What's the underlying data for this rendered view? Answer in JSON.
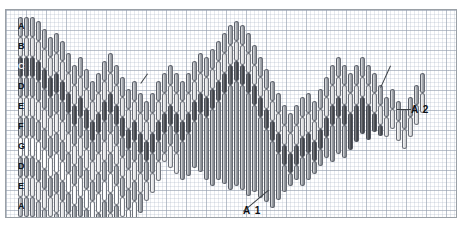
{
  "figure": {
    "title": "",
    "frame": {
      "x": 5,
      "y": 9,
      "width": 450,
      "height": 207,
      "border_color": "#9aa0a6"
    },
    "grid": {
      "minor_px": 4,
      "major_px": 20,
      "minor_color": "#afb9c8",
      "major_color": "#96a0af",
      "visible": true
    },
    "background_color": "#ffffff"
  },
  "legend_column": {
    "description": "First (leftmost) stacked column, each band letter-labelled top to bottom",
    "labels": [
      "A",
      "B",
      "C",
      "D",
      "E",
      "F",
      "G",
      "D",
      "E",
      "A"
    ],
    "shades": [
      "A",
      "B",
      "C",
      "D",
      "E",
      "F",
      "G",
      "D",
      "E",
      "H"
    ],
    "shade_hex": {
      "A": "#9fa3a9",
      "B": "#d9dadc",
      "C": "#4c4f54",
      "D": "#93979d",
      "E": "#e3e4e6",
      "F": "#9a9ea4",
      "G": "#ffffff",
      "H": "#b0b4b9"
    }
  },
  "annotations": [
    {
      "name": "A1",
      "label": "A 1",
      "x": 243,
      "y": 211,
      "points_to_x": 268,
      "points_to_y": 190
    },
    {
      "name": "A2",
      "label": "A 2",
      "x": 411,
      "y": 110,
      "points_to_x": 397,
      "points_to_y": 110
    },
    {
      "name": "pointer-left",
      "label": "",
      "x": 148,
      "y": 74,
      "points_to_x": 141,
      "points_to_y": 84
    },
    {
      "name": "pointer-right",
      "label": "",
      "x": 391,
      "y": 66,
      "points_to_x": 381,
      "points_to_y": 88
    }
  ],
  "chart_data": {
    "type": "bar",
    "subtype": "stacked-band candlestick profile",
    "title": "",
    "xlabel": "",
    "ylabel": "",
    "xlim": [
      0,
      450
    ],
    "ylim": [
      0,
      207
    ],
    "grid": true,
    "legend_position": "inline-left-column",
    "band_order": [
      "A",
      "B",
      "C",
      "D",
      "E",
      "F",
      "G",
      "D",
      "E",
      "A"
    ],
    "band_shades": [
      "A",
      "B",
      "C",
      "D",
      "E",
      "F",
      "G",
      "D",
      "E",
      "H"
    ],
    "note": "Each x position is one vertical column. 'top' is the pixel y of the column's upper end inside the plot, 'segments' is how many of the band_order bands are drawn downward from that top. Columns are 5px wide on a 6px pitch.",
    "bar_pitch": 6,
    "bar_width": 5,
    "band_height": 20,
    "columns": [
      {
        "x": 12,
        "top": 7,
        "segments": 10
      },
      {
        "x": 18,
        "top": 7,
        "segments": 10
      },
      {
        "x": 24,
        "top": 7,
        "segments": 10
      },
      {
        "x": 30,
        "top": 11,
        "segments": 10
      },
      {
        "x": 36,
        "top": 19,
        "segments": 10
      },
      {
        "x": 42,
        "top": 27,
        "segments": 10
      },
      {
        "x": 48,
        "top": 23,
        "segments": 10
      },
      {
        "x": 54,
        "top": 31,
        "segments": 10
      },
      {
        "x": 60,
        "top": 43,
        "segments": 9
      },
      {
        "x": 66,
        "top": 55,
        "segments": 9
      },
      {
        "x": 72,
        "top": 47,
        "segments": 9
      },
      {
        "x": 78,
        "top": 59,
        "segments": 9
      },
      {
        "x": 84,
        "top": 71,
        "segments": 8
      },
      {
        "x": 90,
        "top": 63,
        "segments": 9
      },
      {
        "x": 96,
        "top": 51,
        "segments": 9
      },
      {
        "x": 102,
        "top": 43,
        "segments": 9
      },
      {
        "x": 108,
        "top": 55,
        "segments": 9
      },
      {
        "x": 114,
        "top": 67,
        "segments": 8
      },
      {
        "x": 120,
        "top": 79,
        "segments": 7
      },
      {
        "x": 126,
        "top": 71,
        "segments": 7
      },
      {
        "x": 132,
        "top": 83,
        "segments": 6
      },
      {
        "x": 138,
        "top": 91,
        "segments": 5
      },
      {
        "x": 144,
        "top": 83,
        "segments": 5
      },
      {
        "x": 150,
        "top": 71,
        "segments": 5
      },
      {
        "x": 156,
        "top": 63,
        "segments": 4
      },
      {
        "x": 162,
        "top": 55,
        "segments": 4
      },
      {
        "x": 168,
        "top": 63,
        "segments": 4
      },
      {
        "x": 174,
        "top": 71,
        "segments": 3
      },
      {
        "x": 180,
        "top": 63,
        "segments": 3
      },
      {
        "x": 186,
        "top": 51,
        "segments": 3
      },
      {
        "x": 192,
        "top": 43,
        "segments": 3
      },
      {
        "x": 198,
        "top": 47,
        "segments": 3
      },
      {
        "x": 204,
        "top": 39,
        "segments": 3
      },
      {
        "x": 210,
        "top": 31,
        "segments": 3
      },
      {
        "x": 216,
        "top": 23,
        "segments": 3
      },
      {
        "x": 222,
        "top": 15,
        "segments": 3
      },
      {
        "x": 228,
        "top": 11,
        "segments": 3
      },
      {
        "x": 234,
        "top": 15,
        "segments": 3
      },
      {
        "x": 240,
        "top": 23,
        "segments": 3
      },
      {
        "x": 246,
        "top": 35,
        "segments": 3
      },
      {
        "x": 252,
        "top": 47,
        "segments": 3
      },
      {
        "x": 258,
        "top": 59,
        "segments": 3
      },
      {
        "x": 264,
        "top": 71,
        "segments": 3
      },
      {
        "x": 270,
        "top": 83,
        "segments": 3
      },
      {
        "x": 276,
        "top": 95,
        "segments": 3
      },
      {
        "x": 282,
        "top": 103,
        "segments": 3
      },
      {
        "x": 288,
        "top": 95,
        "segments": 3
      },
      {
        "x": 294,
        "top": 87,
        "segments": 3
      },
      {
        "x": 300,
        "top": 83,
        "segments": 3
      },
      {
        "x": 306,
        "top": 91,
        "segments": 3
      },
      {
        "x": 312,
        "top": 79,
        "segments": 3
      },
      {
        "x": 318,
        "top": 67,
        "segments": 3
      },
      {
        "x": 324,
        "top": 55,
        "segments": 3
      },
      {
        "x": 330,
        "top": 47,
        "segments": 3
      },
      {
        "x": 336,
        "top": 55,
        "segments": 3
      },
      {
        "x": 342,
        "top": 63,
        "segments": 2
      },
      {
        "x": 348,
        "top": 55,
        "segments": 2
      },
      {
        "x": 354,
        "top": 47,
        "segments": 2
      },
      {
        "x": 360,
        "top": 55,
        "segments": 2
      },
      {
        "x": 366,
        "top": 63,
        "segments": 2
      },
      {
        "x": 372,
        "top": 75,
        "segments": 2
      },
      {
        "x": 378,
        "top": 87,
        "segments": 2
      },
      {
        "x": 384,
        "top": 79,
        "segments": 2
      },
      {
        "x": 390,
        "top": 91,
        "segments": 2
      },
      {
        "x": 396,
        "top": 99,
        "segments": 2
      },
      {
        "x": 402,
        "top": 87,
        "segments": 2
      },
      {
        "x": 408,
        "top": 75,
        "segments": 2
      },
      {
        "x": 414,
        "top": 63,
        "segments": 2
      }
    ],
    "lower_columns": [
      {
        "x": 150,
        "bottom": 148
      },
      {
        "x": 156,
        "bottom": 152
      },
      {
        "x": 162,
        "bottom": 158
      },
      {
        "x": 168,
        "bottom": 164
      },
      {
        "x": 174,
        "bottom": 170
      },
      {
        "x": 180,
        "bottom": 166
      },
      {
        "x": 186,
        "bottom": 158
      },
      {
        "x": 192,
        "bottom": 162
      },
      {
        "x": 198,
        "bottom": 170
      },
      {
        "x": 204,
        "bottom": 176
      },
      {
        "x": 210,
        "bottom": 170
      },
      {
        "x": 216,
        "bottom": 174
      },
      {
        "x": 222,
        "bottom": 180
      },
      {
        "x": 228,
        "bottom": 176
      },
      {
        "x": 234,
        "bottom": 180
      },
      {
        "x": 240,
        "bottom": 186
      },
      {
        "x": 246,
        "bottom": 182
      },
      {
        "x": 252,
        "bottom": 188
      },
      {
        "x": 258,
        "bottom": 192
      },
      {
        "x": 264,
        "bottom": 198
      },
      {
        "x": 270,
        "bottom": 190
      },
      {
        "x": 276,
        "bottom": 182
      },
      {
        "x": 282,
        "bottom": 176
      },
      {
        "x": 288,
        "bottom": 170
      },
      {
        "x": 294,
        "bottom": 176
      },
      {
        "x": 300,
        "bottom": 170
      },
      {
        "x": 306,
        "bottom": 164
      },
      {
        "x": 312,
        "bottom": 156
      },
      {
        "x": 318,
        "bottom": 148
      },
      {
        "x": 324,
        "bottom": 152
      },
      {
        "x": 330,
        "bottom": 144
      },
      {
        "x": 336,
        "bottom": 148
      },
      {
        "x": 342,
        "bottom": 140
      },
      {
        "x": 348,
        "bottom": 132
      },
      {
        "x": 354,
        "bottom": 124
      },
      {
        "x": 360,
        "bottom": 130
      },
      {
        "x": 366,
        "bottom": 122
      },
      {
        "x": 372,
        "bottom": 126
      },
      {
        "x": 378,
        "bottom": 118
      },
      {
        "x": 384,
        "bottom": 112
      },
      {
        "x": 390,
        "bottom": 116
      },
      {
        "x": 396,
        "bottom": 110
      },
      {
        "x": 402,
        "bottom": 104
      },
      {
        "x": 408,
        "bottom": 96
      },
      {
        "x": 414,
        "bottom": 88
      }
    ]
  }
}
